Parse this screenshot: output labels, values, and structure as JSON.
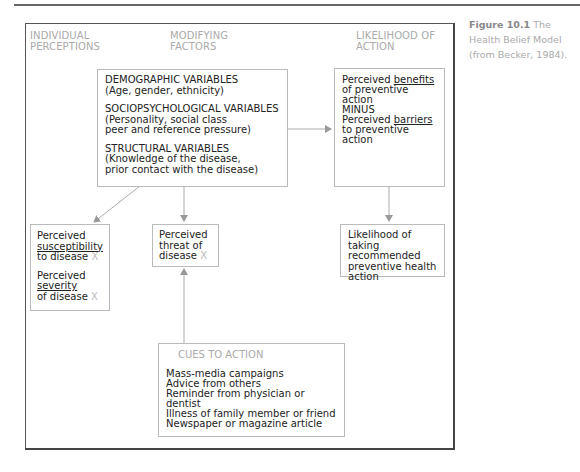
{
  "columns": {
    "individual": [
      "INDIVIDUAL",
      "PERCEPTIONS"
    ],
    "modifying": [
      "MODIFYING",
      "FACTORS"
    ],
    "likelihood": [
      "LIKELIHOOD OF",
      "ACTION"
    ]
  },
  "modifying_box": {
    "demographic_title": "DEMOGRAPHIC VARIABLES",
    "demographic_detail": "(Age, gender, ethnicity)",
    "socio_title": "SOCIOPSYCHOLOGICAL VARIABLES",
    "socio_detail_1": "(Personality, social class",
    "socio_detail_2": "peer and reference pressure)",
    "structural_title": "STRUCTURAL VARIABLES",
    "structural_detail_1": "(Knowledge of the disease,",
    "structural_detail_2": "prior contact with the disease)"
  },
  "benefits_box": {
    "line1_pre": "Perceived ",
    "line1_u": "benefits",
    "line2": "of preventive action",
    "line3": "MINUS",
    "line4_pre": "Perceived ",
    "line4_u": "barriers",
    "line5": "to preventive action"
  },
  "susceptibility_box": {
    "a1": "Perceived",
    "a2": "susceptibility",
    "a3": "to disease",
    "b1": "Perceived",
    "b2": "severity",
    "b3": "of disease",
    "mark": "X"
  },
  "threat_box": {
    "l1": "Perceived",
    "l2": "threat of",
    "l3": "disease",
    "mark": "X"
  },
  "likelihood_box": {
    "l1": "Likelihood of taking",
    "l2": "recommended",
    "l3": "preventive health",
    "l4": "action"
  },
  "cues_box": {
    "title": "CUES TO ACTION",
    "items": [
      "Mass-media campaigns",
      "Advice from others",
      "Reminder from physician or dentist",
      "Illness of family member or friend",
      "Newspaper or magazine article"
    ]
  },
  "caption": {
    "label": "Figure 10.1",
    "text": " The Health Belief Model (from Becker, 1984)."
  }
}
